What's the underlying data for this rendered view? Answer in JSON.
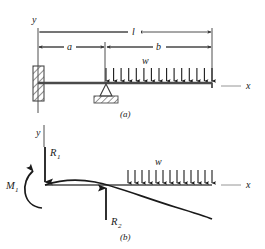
{
  "figure": {
    "type": "beam-loading-diagram",
    "colors": {
      "line": "#1a1a1a",
      "beam": "#4a4a4a",
      "dimension": "#3a3a3a",
      "hatch": "#555555",
      "background": "#ffffff"
    },
    "panels": [
      {
        "id": "panel-a",
        "caption": "(a)",
        "axis_y_label": "y",
        "axis_x_label": "x",
        "dimensions": [
          {
            "name": "total-length",
            "label": "l"
          },
          {
            "name": "left-span",
            "label": "a"
          },
          {
            "name": "right-span",
            "label": "b"
          }
        ],
        "load_label": "w",
        "load_arrow_count": 15,
        "supports": [
          {
            "name": "fixed-wall-support",
            "kind": "fixed"
          },
          {
            "name": "pin-support",
            "kind": "pin"
          }
        ]
      },
      {
        "id": "panel-b",
        "caption": "(b)",
        "axis_y_label": "y",
        "axis_x_label": "x",
        "load_label": "w",
        "load_arrow_count": 13,
        "reactions": [
          {
            "name": "reaction-r1",
            "label": "R",
            "subscript": "1",
            "direction": "down"
          },
          {
            "name": "reaction-r2",
            "label": "R",
            "subscript": "2",
            "direction": "up"
          }
        ],
        "moment": {
          "name": "moment-m1",
          "label": "M",
          "subscript": "1",
          "direction": "counterclockwise"
        }
      }
    ]
  }
}
